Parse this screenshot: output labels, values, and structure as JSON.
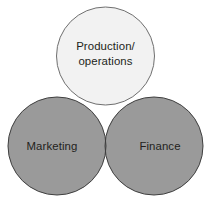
{
  "diagram": {
    "type": "venn",
    "background_color": "#ffffff",
    "set_count": 3,
    "sets": [
      {
        "id": "production-operations",
        "label_lines": [
          "Production/",
          "operations"
        ],
        "label_text": "Production/operations",
        "position": "top",
        "fill_color": "#f2f2f2",
        "stroke_color": "#6f6f6f",
        "center_x": 105.5,
        "center_y": 56,
        "radius": 49,
        "label_x": 105.5,
        "label_y_line1": 50,
        "label_y_line2": 65
      },
      {
        "id": "marketing",
        "label_lines": [
          "Marketing"
        ],
        "label_text": "Marketing",
        "position": "bottom-left",
        "fill_color": "#9a9a9a",
        "stroke_color": "#3f3f3f",
        "center_x": 57,
        "center_y": 146,
        "radius": 49,
        "label_x": 52,
        "label_y_line1": 150
      },
      {
        "id": "finance",
        "label_lines": [
          "Finance"
        ],
        "label_text": "Finance",
        "position": "bottom-right",
        "fill_color": "#9a9a9a",
        "stroke_color": "#3f3f3f",
        "center_x": 154,
        "center_y": 146,
        "radius": 49,
        "label_x": 160,
        "label_y_line1": 150
      }
    ],
    "overlap_regions": [
      {
        "id": "production-marketing",
        "sets": [
          "production-operations",
          "marketing"
        ],
        "fill_color": "#878787"
      },
      {
        "id": "production-finance",
        "sets": [
          "production-operations",
          "finance"
        ],
        "fill_color": "#878787"
      },
      {
        "id": "marketing-finance",
        "sets": [
          "marketing",
          "finance"
        ],
        "fill_color": "#9a9a9a"
      },
      {
        "id": "all-three",
        "sets": [
          "production-operations",
          "marketing",
          "finance"
        ],
        "fill_color": "#7e7e7e"
      }
    ]
  }
}
